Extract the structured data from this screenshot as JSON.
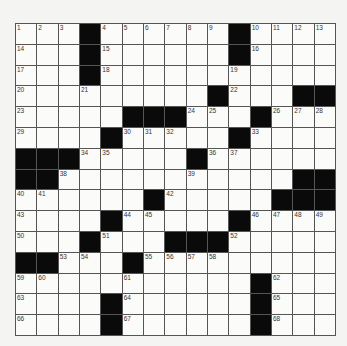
{
  "puzzle": {
    "rows": 15,
    "cols": 15,
    "grid": [
      [
        "1",
        "2",
        "3",
        "#",
        "4",
        "5",
        "6",
        "7",
        "8",
        "9",
        "#",
        "10",
        "11",
        "12",
        "13"
      ],
      [
        "14",
        ".",
        ".",
        "#",
        "15",
        ".",
        ".",
        ".",
        ".",
        ".",
        "#",
        "16",
        ".",
        ".",
        "."
      ],
      [
        "17",
        ".",
        ".",
        "#",
        "18",
        ".",
        ".",
        ".",
        ".",
        ".",
        "19",
        ".",
        ".",
        ".",
        "."
      ],
      [
        "20",
        ".",
        ".",
        "21",
        ".",
        ".",
        ".",
        ".",
        ".",
        "#",
        "22",
        ".",
        ".",
        "#",
        "#"
      ],
      [
        "23",
        ".",
        ".",
        ".",
        ".",
        "#",
        "#",
        "#",
        "24",
        "25",
        ".",
        "#",
        "26",
        "27",
        "28"
      ],
      [
        "29",
        ".",
        ".",
        ".",
        "#",
        "30",
        "31",
        "32",
        ".",
        ".",
        "#",
        "33",
        ".",
        ".",
        "."
      ],
      [
        "#",
        "#",
        "#",
        "34",
        "35",
        ".",
        ".",
        ".",
        "#",
        "36",
        "37",
        ".",
        ".",
        ".",
        "."
      ],
      [
        "#",
        "#",
        "38",
        ".",
        ".",
        ".",
        ".",
        ".",
        "39",
        ".",
        ".",
        ".",
        ".",
        "#",
        "#"
      ],
      [
        "40",
        "41",
        ".",
        ".",
        ".",
        ".",
        "#",
        "42",
        ".",
        ".",
        ".",
        ".",
        "#",
        "#",
        "#"
      ],
      [
        "43",
        ".",
        ".",
        ".",
        "#",
        "44",
        "45",
        ".",
        ".",
        ".",
        "#",
        "46",
        "47",
        "48",
        "49"
      ],
      [
        "50",
        ".",
        ".",
        "#",
        "51",
        ".",
        ".",
        "#",
        "#",
        "#",
        "52",
        ".",
        ".",
        ".",
        "."
      ],
      [
        "#",
        "#",
        "53",
        "54",
        ".",
        "#",
        "55",
        "56",
        "57",
        "58",
        ".",
        ".",
        ".",
        ".",
        "."
      ],
      [
        "59",
        "60",
        ".",
        ".",
        ".",
        "61",
        ".",
        ".",
        ".",
        ".",
        ".",
        "#",
        "62",
        ".",
        "."
      ],
      [
        "63",
        ".",
        ".",
        ".",
        "#",
        "64",
        ".",
        ".",
        ".",
        ".",
        ".",
        "#",
        "65",
        ".",
        "."
      ],
      [
        "66",
        ".",
        ".",
        ".",
        "#",
        "67",
        ".",
        ".",
        ".",
        ".",
        ".",
        "#",
        "68",
        ".",
        "."
      ]
    ]
  },
  "colors": {
    "black_cell": "#0a0a0a",
    "white_cell": "#fbfbfa",
    "grid_line": "#555555",
    "background": "#f4f4f2"
  }
}
